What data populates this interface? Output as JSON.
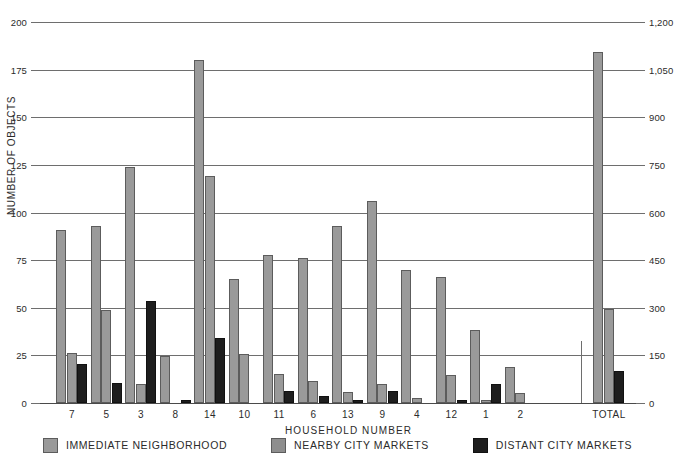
{
  "chart_data": {
    "type": "bar",
    "title": "",
    "xlabel": "HOUSEHOLD NUMBER",
    "ylabel": "NUMBER OF OBJECTS",
    "grid": true,
    "legend_position": "bottom",
    "categories": [
      "7",
      "5",
      "3",
      "8",
      "14",
      "10",
      "11",
      "6",
      "13",
      "9",
      "4",
      "12",
      "1",
      "2"
    ],
    "total_category": "TOTAL",
    "left_axis": {
      "label": "NUMBER OF OBJECTS",
      "ticks": [
        0,
        25,
        50,
        75,
        100,
        125,
        150,
        175,
        200
      ],
      "tick_labels": [
        "0",
        "25",
        "50",
        "75",
        "100",
        "125",
        "150",
        "175",
        "200"
      ],
      "ylim": [
        0,
        200
      ]
    },
    "right_axis": {
      "label": "",
      "ticks": [
        0,
        150,
        300,
        450,
        600,
        750,
        900,
        1050,
        1200
      ],
      "tick_labels": [
        "0",
        "150",
        "300",
        "450",
        "600",
        "750",
        "900",
        "1,050",
        "1,200"
      ],
      "ylim": [
        0,
        1200
      ]
    },
    "series": [
      {
        "name": "IMMEDIATE NEIGHBORHOOD",
        "color": "#9a9a9a",
        "values": [
          91,
          93,
          124,
          24.5,
          180,
          65,
          77.5,
          76,
          93,
          106,
          70,
          66,
          38.5,
          19
        ],
        "total": 1105
      },
      {
        "name": "NEARBY CITY MARKETS",
        "color": "#9a9a9a",
        "values": [
          26.5,
          49,
          10,
          0,
          119,
          25.5,
          15,
          11.5,
          6,
          10,
          2.5,
          14.5,
          1.5,
          5.5
        ],
        "total": 295
      },
      {
        "name": "DISTANT CITY MARKETS",
        "color": "#1e1e1e",
        "values": [
          20.5,
          10.5,
          53.5,
          1.5,
          34,
          0,
          6.5,
          3.5,
          1.5,
          6.5,
          0,
          1.5,
          10,
          0
        ],
        "total": 100
      }
    ]
  },
  "legend": {
    "items": [
      {
        "label": "IMMEDIATE NEIGHBORHOOD",
        "swatch": "s0"
      },
      {
        "label": "NEARBY CITY MARKETS",
        "swatch": "s1"
      },
      {
        "label": "DISTANT CITY MARKETS",
        "swatch": "s2"
      }
    ]
  }
}
